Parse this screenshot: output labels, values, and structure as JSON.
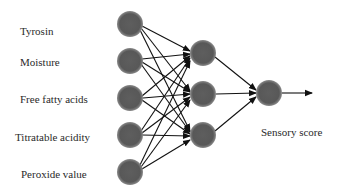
{
  "diagram": {
    "type": "neural-network",
    "layers": [
      {
        "name": "input",
        "node_count": 5
      },
      {
        "name": "hidden",
        "node_count": 3
      },
      {
        "name": "output",
        "node_count": 1
      }
    ],
    "inputs": [
      {
        "label": "Tyrosin"
      },
      {
        "label": "Moisture"
      },
      {
        "label": "Free fatty acids"
      },
      {
        "label": "Titratable acidity"
      },
      {
        "label": "Peroxide value"
      }
    ],
    "output": {
      "label": "Sensory score"
    },
    "colors": {
      "node": "#5c5c5c",
      "edge": "#111111",
      "text": "#2a2a2a"
    }
  }
}
